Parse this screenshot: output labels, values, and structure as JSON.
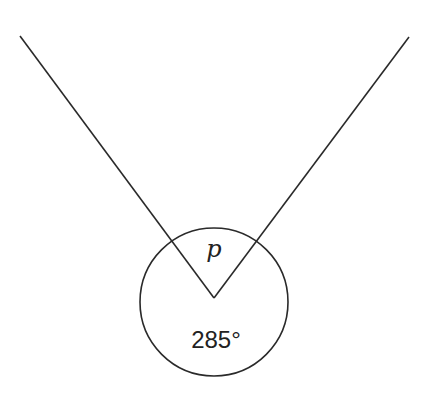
{
  "diagram": {
    "type": "angle-diagram",
    "labels": {
      "inner_angle": "p",
      "reflex_angle": "285°"
    },
    "vertex": [
      214,
      298
    ],
    "rays": [
      {
        "from": [
          214,
          298
        ],
        "to": [
          20,
          36
        ]
      },
      {
        "from": [
          214,
          298
        ],
        "to": [
          409,
          37
        ]
      }
    ],
    "circle": {
      "cx": 214,
      "cy": 302,
      "r": 74
    },
    "colors": {
      "stroke": "#2a2a2a",
      "background": "#ffffff"
    }
  }
}
